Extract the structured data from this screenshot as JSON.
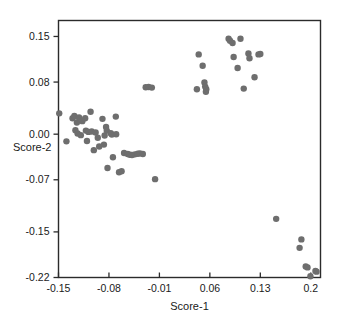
{
  "chart_data": {
    "type": "scatter",
    "title": "",
    "xlabel": "Score-1",
    "ylabel": "Score-2",
    "xlim": [
      -0.15,
      0.2135
    ],
    "ylim": [
      -0.22,
      0.1745
    ],
    "xticks": [
      -0.15,
      -0.08,
      -0.01,
      0.06,
      0.13,
      0.2
    ],
    "xtick_labels": [
      "-0.15",
      "-0.08",
      "-0.01",
      "0.06",
      "0.13",
      "0.2"
    ],
    "yticks": [
      0.15,
      0.08,
      0.0,
      -0.07,
      -0.15,
      -0.22
    ],
    "ytick_labels": [
      "0.15",
      "0.08",
      "0.00",
      "-0.07",
      "-0.15",
      "-0.22"
    ],
    "grid": false,
    "legend": false,
    "marker": {
      "shape": "circle",
      "color": "#6e6e6e",
      "size_px": 6.4,
      "opacity": 1
    },
    "frame_color": "#2b2b2b",
    "background": "#ffffff",
    "n_points": 72,
    "series": [
      {
        "name": "scores",
        "points": [
          [
            -0.149,
            0.032
          ],
          [
            -0.139,
            -0.011
          ],
          [
            -0.1305,
            0.0245
          ],
          [
            -0.128,
            0.028
          ],
          [
            -0.1265,
            0.006
          ],
          [
            -0.1245,
            0.018
          ],
          [
            -0.1235,
            0.001
          ],
          [
            -0.1215,
            0.0255
          ],
          [
            -0.119,
            -0.0015
          ],
          [
            -0.117,
            0.02
          ],
          [
            -0.113,
            0.0245
          ],
          [
            -0.112,
            0.0055
          ],
          [
            -0.1105,
            -0.0105
          ],
          [
            -0.1085,
            0.0035
          ],
          [
            -0.1055,
            0.0345
          ],
          [
            -0.104,
            0.004
          ],
          [
            -0.101,
            -0.0245
          ],
          [
            -0.0985,
            0.0025
          ],
          [
            -0.0955,
            -0.0055
          ],
          [
            -0.0935,
            -0.019
          ],
          [
            -0.089,
            0.0235
          ],
          [
            -0.087,
            -0.016
          ],
          [
            -0.086,
            -0.002
          ],
          [
            -0.084,
            0.011
          ],
          [
            -0.083,
            0.0055
          ],
          [
            -0.082,
            -0.052
          ],
          [
            -0.0775,
            0.0015
          ],
          [
            -0.076,
            -0.0005
          ],
          [
            -0.0745,
            -0.0355
          ],
          [
            -0.0705,
            0.027
          ],
          [
            -0.07,
            0.0
          ],
          [
            -0.066,
            -0.0585
          ],
          [
            -0.0625,
            -0.057
          ],
          [
            -0.059,
            -0.029
          ],
          [
            -0.054,
            -0.0305
          ],
          [
            -0.051,
            -0.0315
          ],
          [
            -0.048,
            -0.032
          ],
          [
            -0.044,
            -0.031
          ],
          [
            -0.04,
            -0.03
          ],
          [
            -0.037,
            -0.0295
          ],
          [
            -0.033,
            -0.0305
          ],
          [
            -0.029,
            0.072
          ],
          [
            -0.025,
            0.0725
          ],
          [
            -0.0205,
            0.0715
          ],
          [
            -0.016,
            -0.069
          ],
          [
            0.042,
            0.069
          ],
          [
            0.0445,
            0.1225
          ],
          [
            0.05,
            0.105
          ],
          [
            0.0525,
            0.0795
          ],
          [
            0.0535,
            0.073
          ],
          [
            0.0545,
            0.065
          ],
          [
            0.055,
            0.069
          ],
          [
            0.086,
            0.1465
          ],
          [
            0.088,
            0.1435
          ],
          [
            0.0915,
            0.14
          ],
          [
            0.093,
            0.1185
          ],
          [
            0.0985,
            0.1015
          ],
          [
            0.1025,
            0.1465
          ],
          [
            0.107,
            0.07
          ],
          [
            0.1135,
            0.124
          ],
          [
            0.115,
            0.1165
          ],
          [
            0.122,
            0.0875
          ],
          [
            0.1275,
            0.1225
          ],
          [
            0.13,
            0.123
          ],
          [
            0.152,
            -0.13
          ],
          [
            0.1845,
            -0.1745
          ],
          [
            0.187,
            -0.1615
          ],
          [
            0.193,
            -0.203
          ],
          [
            0.1955,
            -0.2045
          ],
          [
            0.1995,
            -0.218
          ],
          [
            0.2065,
            -0.21
          ],
          [
            0.208,
            -0.211
          ]
        ]
      }
    ]
  },
  "axes": {
    "x_title": "Score-1",
    "y_title": "Score-2"
  }
}
